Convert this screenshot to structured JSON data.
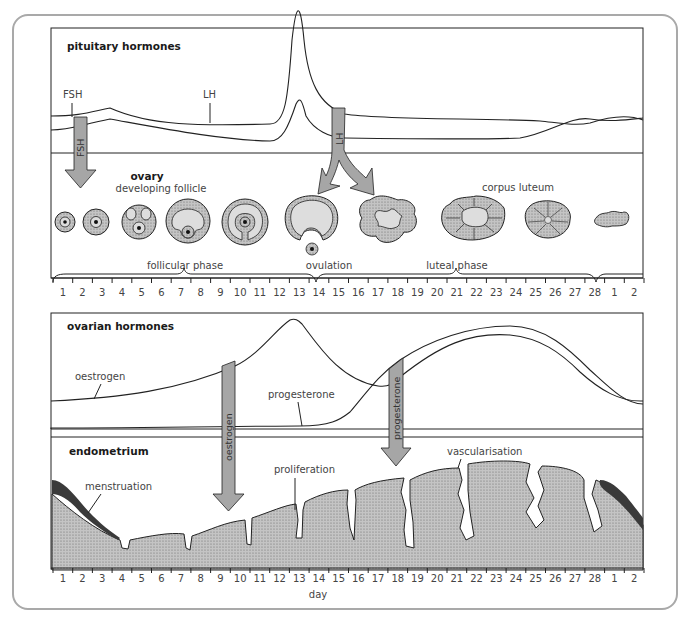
{
  "panel_top": {
    "pituitary_title": "pituitary hormones",
    "fsh_label": "FSH",
    "lh_label": "LH",
    "fsh_arrow_label": "FSH",
    "lh_arrow_label": "LH",
    "ovary_title": "ovary",
    "ovary_subtitle": "developing follicle",
    "corpus_luteum_label": "corpus luteum",
    "ovulation_label": "ovulation",
    "follicular_phase_label": "follicular phase",
    "luteal_phase_label": "luteal phase"
  },
  "panel_bottom": {
    "ovarian_title": "ovarian hormones",
    "oestrogen_label": "oestrogen",
    "progesterone_label": "progesterone",
    "oestrogen_arrow_label": "oestrogen",
    "progesterone_arrow_label": "progesterone",
    "endometrium_title": "endometrium",
    "menstruation_label": "menstruation",
    "proliferation_label": "proliferation",
    "vascularisation_label": "vascularisation",
    "x_axis_label": "day"
  },
  "axis_days": [
    "1",
    "2",
    "3",
    "4",
    "5",
    "6",
    "7",
    "8",
    "9",
    "10",
    "11",
    "12",
    "13",
    "14",
    "15",
    "16",
    "17",
    "18",
    "19",
    "20",
    "21",
    "22",
    "23",
    "24",
    "25",
    "26",
    "27",
    "28",
    "1",
    "2"
  ],
  "colors": {
    "arrow_fill": "#a6a6a6",
    "stipple_fill": "#b8b8b8",
    "follicle_inner": "#d9d9d9",
    "menstrual_dark": "#3a3a3a",
    "line": "#222222",
    "frame": "#a9a9a9"
  }
}
